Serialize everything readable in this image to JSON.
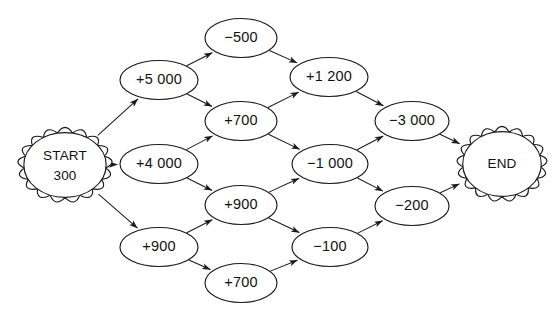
{
  "diagram": {
    "type": "trellis-lattice-graph",
    "title": "",
    "background_color": "#ffffff",
    "line_color": "#1b1b1b",
    "text_color": "#111111",
    "nodes": [
      {
        "id": "start",
        "label_line1": "START",
        "label_line2": "300",
        "shape": "scalloped-ellipse",
        "cx": 65,
        "cy": 165,
        "rx": 44,
        "ry": 35
      },
      {
        "id": "c1a",
        "label": "+5 000",
        "shape": "ellipse",
        "cx": 159,
        "cy": 80,
        "rx": 39,
        "ry": 19.5
      },
      {
        "id": "c1b",
        "label": "+4 000",
        "shape": "ellipse",
        "cx": 159,
        "cy": 164,
        "rx": 39,
        "ry": 19.5
      },
      {
        "id": "c1c",
        "label": "+900",
        "shape": "ellipse",
        "cx": 159,
        "cy": 247,
        "rx": 39,
        "ry": 19.5
      },
      {
        "id": "c2a",
        "label": "−500",
        "shape": "ellipse",
        "cx": 241,
        "cy": 38,
        "rx": 36,
        "ry": 19.5
      },
      {
        "id": "c2b",
        "label": "+700",
        "shape": "ellipse",
        "cx": 241,
        "cy": 121,
        "rx": 36,
        "ry": 19.5
      },
      {
        "id": "c2c",
        "label": "+900",
        "shape": "ellipse",
        "cx": 241,
        "cy": 205,
        "rx": 36,
        "ry": 19.5
      },
      {
        "id": "c2d",
        "label": "+700",
        "shape": "ellipse",
        "cx": 241,
        "cy": 283,
        "rx": 36,
        "ry": 19.5
      },
      {
        "id": "c3a",
        "label": "+1 200",
        "shape": "ellipse",
        "cx": 329,
        "cy": 77,
        "rx": 39,
        "ry": 19.5
      },
      {
        "id": "c3b",
        "label": "−1 000",
        "shape": "ellipse",
        "cx": 330,
        "cy": 164,
        "rx": 38,
        "ry": 19.5
      },
      {
        "id": "c3c",
        "label": "−100",
        "shape": "ellipse",
        "cx": 330,
        "cy": 247,
        "rx": 38,
        "ry": 19.5
      },
      {
        "id": "c4a",
        "label": "−3 000",
        "shape": "ellipse",
        "cx": 412,
        "cy": 121,
        "rx": 37,
        "ry": 19.5
      },
      {
        "id": "c4b",
        "label": "−200",
        "shape": "ellipse",
        "cx": 412,
        "cy": 206,
        "rx": 37,
        "ry": 19.5
      },
      {
        "id": "end",
        "label_line1": "END",
        "shape": "scalloped-ellipse",
        "cx": 502,
        "cy": 164,
        "rx": 42,
        "ry": 35
      }
    ],
    "edges": [
      {
        "from": "start",
        "to": "c1a",
        "arrow": true
      },
      {
        "from": "start",
        "to": "c1b",
        "arrow": true
      },
      {
        "from": "start",
        "to": "c1c",
        "arrow": true
      },
      {
        "from": "c1a",
        "to": "c2a",
        "arrow": true
      },
      {
        "from": "c1a",
        "to": "c2b",
        "arrow": true
      },
      {
        "from": "c1b",
        "to": "c2b",
        "arrow": true
      },
      {
        "from": "c1b",
        "to": "c2c",
        "arrow": true
      },
      {
        "from": "c1c",
        "to": "c2c",
        "arrow": true
      },
      {
        "from": "c1c",
        "to": "c2d",
        "arrow": true
      },
      {
        "from": "c2a",
        "to": "c3a",
        "arrow": true
      },
      {
        "from": "c2b",
        "to": "c3a",
        "arrow": true
      },
      {
        "from": "c2b",
        "to": "c3b",
        "arrow": true
      },
      {
        "from": "c2c",
        "to": "c3b",
        "arrow": true
      },
      {
        "from": "c2c",
        "to": "c3c",
        "arrow": true
      },
      {
        "from": "c2d",
        "to": "c3c",
        "arrow": true
      },
      {
        "from": "c3a",
        "to": "c4a",
        "arrow": true
      },
      {
        "from": "c3b",
        "to": "c4a",
        "arrow": true
      },
      {
        "from": "c3b",
        "to": "c4b",
        "arrow": true
      },
      {
        "from": "c3c",
        "to": "c4b",
        "arrow": true
      },
      {
        "from": "c4a",
        "to": "end",
        "arrow": true
      },
      {
        "from": "c4b",
        "to": "end",
        "arrow": true
      }
    ]
  }
}
